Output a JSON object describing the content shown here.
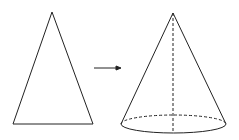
{
  "diagram": {
    "stroke_color": "#222222",
    "background": "#ffffff",
    "triangle": {
      "apex": [
        52,
        12
      ],
      "base_left": [
        13,
        124
      ],
      "base_right": [
        93,
        124
      ]
    },
    "arrow": {
      "from": [
        94,
        68
      ],
      "to": [
        121,
        68
      ]
    },
    "cone": {
      "apex": [
        173,
        13
      ],
      "base_center": [
        173.5,
        124
      ],
      "base_rx": 52.5,
      "base_ry": 9,
      "axis_style": "dashed",
      "hidden_base_arc_style": "dashed"
    }
  }
}
